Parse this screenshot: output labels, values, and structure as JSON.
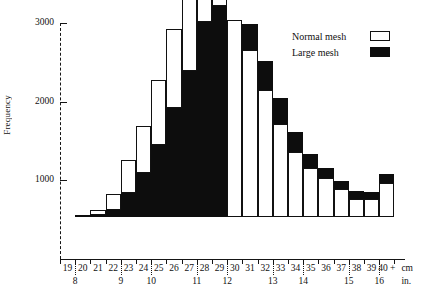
{
  "chart_data": {
    "type": "bar",
    "subtype": "stacked-histogram",
    "title": "",
    "xlabel": "",
    "ylabel": "Frequency",
    "ylim": [
      0,
      3000
    ],
    "yticks": [
      1000,
      2000,
      3000
    ],
    "grid": false,
    "legend_position": "top-right",
    "x_unit_primary": "cm",
    "x_unit_secondary": "in.",
    "categories": [
      "19",
      "20",
      "21",
      "22",
      "23",
      "24",
      "25",
      "26",
      "27",
      "28",
      "29",
      "30",
      "31",
      "32",
      "33",
      "34",
      "35",
      "36",
      "37",
      "38",
      "39",
      "40 +"
    ],
    "secondary_axis_ticks": [
      {
        "label": "8",
        "at_category": "20"
      },
      {
        "label": "9",
        "at_category": "23"
      },
      {
        "label": "10",
        "at_category": "25"
      },
      {
        "label": "11",
        "at_category": "28"
      },
      {
        "label": "12",
        "at_category": "30"
      },
      {
        "label": "13",
        "at_category": "33"
      },
      {
        "label": "14",
        "at_category": "35"
      },
      {
        "label": "15",
        "at_category": "38"
      },
      {
        "label": "16",
        "at_category": "40 +"
      }
    ],
    "series": [
      {
        "name": "Normal mesh",
        "color": "#ffffff",
        "values": [
          0,
          10,
          60,
          200,
          430,
          600,
          820,
          1010,
          1170,
          1330,
          2950,
          2500,
          2120,
          1620,
          1180,
          830,
          620,
          490,
          350,
          230,
          225,
          430
        ]
      },
      {
        "name": "Large mesh",
        "color": "#0d0d0d",
        "values": [
          0,
          5,
          30,
          90,
          300,
          560,
          920,
          1380,
          1860,
          2480,
          2680,
          0,
          330,
          360,
          330,
          250,
          180,
          130,
          110,
          100,
          95,
          120
        ]
      }
    ],
    "stack_order_by_category": {
      "note": "large-mesh segment drawn at base for bins 19-29; drawn on top for bins 30-40+",
      "large_on_bottom": [
        "19",
        "20",
        "21",
        "22",
        "23",
        "24",
        "25",
        "26",
        "27",
        "28",
        "29"
      ],
      "large_on_top": [
        "30",
        "31",
        "32",
        "33",
        "34",
        "35",
        "36",
        "37",
        "38",
        "39",
        "40 +"
      ]
    }
  },
  "legend": {
    "items": [
      {
        "label": "Normal mesh",
        "swatch": "outline-box"
      },
      {
        "label": "Large mesh",
        "swatch": "filled-box"
      }
    ]
  },
  "axis": {
    "y_title": "Frequency",
    "y_tick_labels": [
      "3000",
      "2000",
      "1000"
    ],
    "x_unit_cm": "cm",
    "x_unit_in": "in.",
    "plus_sign": "+"
  }
}
